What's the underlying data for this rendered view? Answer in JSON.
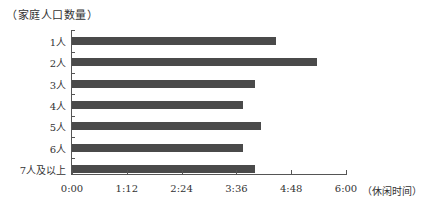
{
  "chart_data": {
    "type": "bar",
    "orientation": "horizontal",
    "title": "",
    "ylabel": "（家庭人口数量）",
    "xlabel": "（休闲时间）",
    "categories": [
      "1人",
      "2人",
      "3人",
      "4人",
      "5人",
      "6人",
      "7人及以上"
    ],
    "values_minutes": [
      268,
      322,
      240,
      225,
      248,
      225,
      240
    ],
    "values_hhmm": [
      "4:28",
      "5:22",
      "4:00",
      "3:45",
      "4:08",
      "3:45",
      "4:00"
    ],
    "x_ticks": [
      "0:00",
      "1:12",
      "2:24",
      "3:36",
      "4:48",
      "6:00"
    ],
    "x_tick_minutes": [
      0,
      72,
      144,
      216,
      288,
      360
    ],
    "xlim_minutes": [
      0,
      360
    ],
    "grid": false,
    "legend": null,
    "bar_color": "#4a4a4a"
  }
}
